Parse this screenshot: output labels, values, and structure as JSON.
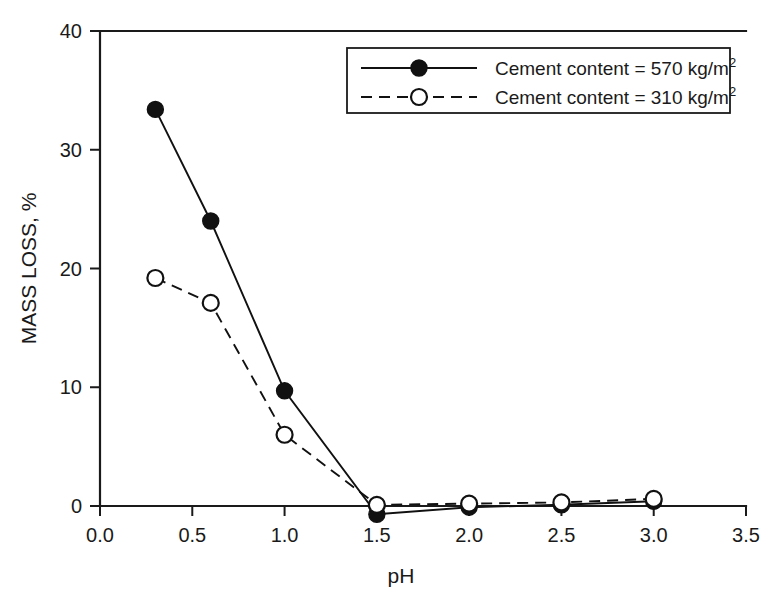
{
  "chart_data": {
    "type": "line",
    "title": "",
    "xlabel": "pH",
    "ylabel": "MASS LOSS, %",
    "xlim": [
      0.0,
      3.5
    ],
    "ylim": [
      0,
      40
    ],
    "xticks": [
      "0.0",
      "0.5",
      "1.0",
      "1.5",
      "2.0",
      "2.5",
      "3.0",
      "3.5"
    ],
    "xtick_values": [
      0.0,
      0.5,
      1.0,
      1.5,
      2.0,
      2.5,
      3.0,
      3.5
    ],
    "yticks": [
      "0",
      "10",
      "20",
      "30",
      "40"
    ],
    "ytick_values": [
      0,
      10,
      20,
      30,
      40
    ],
    "grid": false,
    "legend_position": "top-right",
    "x": [
      0.3,
      0.6,
      1.0,
      1.5,
      2.0,
      2.5,
      3.0
    ],
    "series": [
      {
        "name": "Cement content = 570 kg/m2",
        "label_main": "Cement content = 570 kg/m",
        "label_sup": "2",
        "marker": "filled-circle",
        "linestyle": "solid",
        "values": [
          33.4,
          24.0,
          9.7,
          -0.7,
          -0.1,
          0.1,
          0.4
        ]
      },
      {
        "name": "Cement content = 310 kg/m2",
        "label_main": "Cement content = 310 kg/m",
        "label_sup": "2",
        "marker": "open-circle",
        "linestyle": "dashed",
        "values": [
          19.2,
          17.1,
          6.0,
          0.1,
          0.2,
          0.3,
          0.6
        ]
      }
    ]
  },
  "colors": {
    "ink": "#1a1a1a",
    "background": "#ffffff"
  }
}
